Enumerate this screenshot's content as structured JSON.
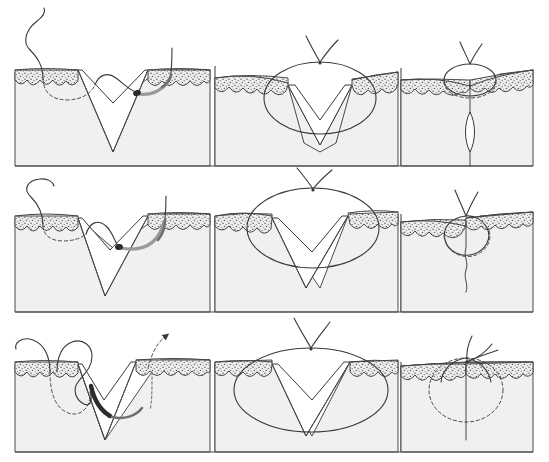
{
  "figure": {
    "title": "Suture technique sequence",
    "description": "Nine-panel cross-sectional medical illustration of skin showing three suturing techniques, each in three sequential stages.",
    "background_color": "#ffffff",
    "canvas": {
      "width": 549,
      "height": 462
    }
  },
  "palette": {
    "dermis_fill": "#f0f0f0",
    "epidermis_fill": "#e2e2e2",
    "wound_fill": "#ffffff",
    "outline": "#4a4a4a",
    "suture_thread": "#3a3a3a",
    "needle_gray": "#9a9a9a",
    "needle_dark": "#2b2b2b"
  },
  "rows": [
    {
      "id": "row-1",
      "label": "Row 1 - buried dermal suture, deep bite",
      "panels": [
        {
          "id": "r1c1",
          "label": "Needle pass through wound edge",
          "stage": "needle-pass",
          "elements": [
            "skin-block",
            "epidermis-band",
            "wedge-shaped-wound",
            "suture-thread-free-end",
            "curved-needle",
            "dashed-suture-path"
          ]
        },
        {
          "id": "r1c2",
          "label": "Suture loop drawn up, knot forming",
          "stage": "loop-tightening",
          "elements": [
            "skin-block",
            "epidermis-band",
            "wedge-shaped-wound",
            "suture-loop",
            "knot-tails"
          ]
        },
        {
          "id": "r1c3",
          "label": "Wound approximated with everted edges",
          "stage": "closed",
          "elements": [
            "skin-block",
            "epidermis-band",
            "closed-wound-line",
            "suture-loop",
            "knot-tails",
            "dashed-suture-path"
          ]
        }
      ]
    },
    {
      "id": "row-2",
      "label": "Row 2 - wider bite buried suture",
      "panels": [
        {
          "id": "r2c1",
          "label": "Needle pass with wider dermal bite",
          "stage": "needle-pass",
          "elements": [
            "skin-block",
            "epidermis-band",
            "wedge-shaped-wound",
            "suture-thread-free-end",
            "curved-needle",
            "dashed-suture-path"
          ]
        },
        {
          "id": "r2c2",
          "label": "Large suture loop elevating wound edges",
          "stage": "loop-tightening",
          "elements": [
            "skin-block",
            "epidermis-band",
            "wedge-shaped-wound",
            "large-suture-loop",
            "knot-tails"
          ]
        },
        {
          "id": "r2c3",
          "label": "Closed wound with slightly offset edges",
          "stage": "closed",
          "elements": [
            "skin-block",
            "epidermis-band",
            "closed-wound-line",
            "suture-loop",
            "knot-tails",
            "dashed-suture-path"
          ]
        }
      ]
    },
    {
      "id": "row-3",
      "label": "Row 3 - reverse needle direction technique",
      "panels": [
        {
          "id": "r3c1",
          "label": "Reverse needle pass with direction arrow",
          "stage": "needle-pass",
          "elements": [
            "skin-block",
            "epidermis-band",
            "wedge-shaped-wound",
            "suture-thread-free-end",
            "dark-curved-needle",
            "dashed-suture-path",
            "direction-arrow"
          ]
        },
        {
          "id": "r3c2",
          "label": "Suture loop spanning the wound",
          "stage": "loop-tightening",
          "elements": [
            "skin-block",
            "epidermis-band",
            "wedge-shaped-wound",
            "suture-loop",
            "knot-tails"
          ]
        },
        {
          "id": "r3c3",
          "label": "Final flat closure with knot at surface",
          "stage": "closed",
          "elements": [
            "skin-block",
            "epidermis-band",
            "closed-wound-line",
            "knot",
            "knot-tails",
            "dashed-suture-path"
          ]
        }
      ]
    }
  ],
  "legend": {
    "solid_line": "Suture thread in front of plane",
    "dashed_line": "Suture thread buried within tissue",
    "gray_arc": "Curved surgical needle",
    "stippled_band": "Epidermis"
  }
}
